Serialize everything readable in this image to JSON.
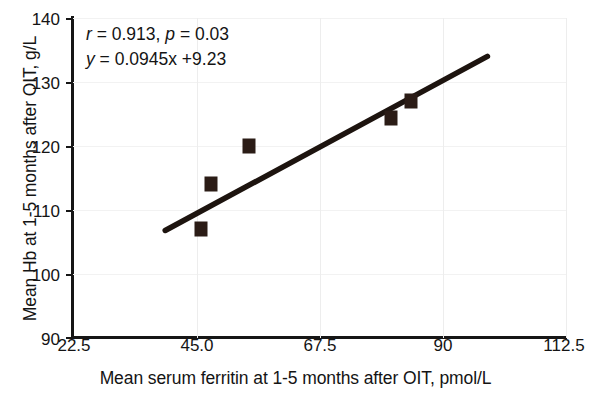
{
  "chart_data": {
    "type": "scatter",
    "title": "",
    "xlabel": "Mean serum ferritin at 1-5 months after OIT, pmol/L",
    "ylabel": "Mean Hb at 1-5 months after OIT, g/L",
    "xlim": [
      22.5,
      112.5
    ],
    "ylim": [
      90,
      140
    ],
    "xticks": [
      "22.5",
      "45.0",
      "67.5",
      "90",
      "112.5"
    ],
    "xtick_values": [
      22.5,
      45.0,
      67.5,
      90,
      112.5
    ],
    "yticks": [
      "90",
      "100",
      "110",
      "120",
      "130",
      "140"
    ],
    "ytick_values": [
      90,
      100,
      110,
      120,
      130,
      140
    ],
    "grid": "faint vertical and horizontal gridlines",
    "legend": "none",
    "marker_color": "#2b1c16",
    "line_color": "#1d140f",
    "points": [
      {
        "x": 45.8,
        "y": 107.0
      },
      {
        "x": 47.6,
        "y": 114.0
      },
      {
        "x": 54.5,
        "y": 120.0
      },
      {
        "x": 80.5,
        "y": 124.3
      },
      {
        "x": 84.0,
        "y": 127.0
      }
    ],
    "fit_line": {
      "slope": 0.0945,
      "intercept": 9.23,
      "x_start": 39.3,
      "x_end": 98.0,
      "y_start": 106.8,
      "y_end": 134.0
    },
    "annotations": {
      "line1_stat_r_symbol": "r",
      "line1_stat_r_value": " = 0.913,  ",
      "line1_stat_p_symbol": "p",
      "line1_stat_p_value": " = 0.03",
      "line2_eq_symbol": "y",
      "line2_eq_value": " = 0.0945x +9.23"
    }
  }
}
